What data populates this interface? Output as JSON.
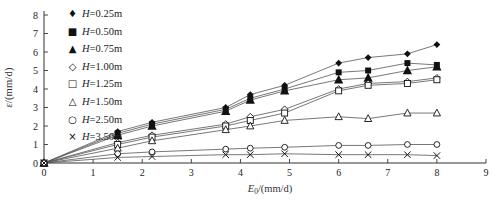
{
  "chart_data": {
    "type": "scatter",
    "x": [
      0,
      1.5,
      2.2,
      3.7,
      4.2,
      4.9,
      6.0,
      6.6,
      7.4,
      8.0
    ],
    "series": [
      {
        "name": "H=0.25m",
        "marker": "filled-diamond",
        "values": [
          0,
          1.7,
          2.2,
          3.0,
          3.7,
          4.2,
          5.4,
          5.7,
          5.9,
          6.4
        ]
      },
      {
        "name": "H=0.50m",
        "marker": "filled-square",
        "values": [
          0,
          1.6,
          2.1,
          2.9,
          3.5,
          4.0,
          4.9,
          5.0,
          5.4,
          5.3
        ]
      },
      {
        "name": "H=0.75m",
        "marker": "filled-triangle",
        "values": [
          0,
          1.5,
          2.0,
          2.8,
          3.4,
          3.9,
          4.5,
          4.6,
          5.0,
          5.2
        ]
      },
      {
        "name": "H=1.00m",
        "marker": "open-diamond",
        "values": [
          0,
          1.1,
          1.5,
          2.1,
          2.5,
          2.9,
          4.0,
          4.3,
          4.4,
          4.6
        ]
      },
      {
        "name": "H=1.25m",
        "marker": "open-square",
        "values": [
          0,
          1.0,
          1.4,
          2.0,
          2.3,
          2.7,
          3.9,
          4.2,
          4.3,
          4.5
        ]
      },
      {
        "name": "H=1.50m",
        "marker": "open-triangle",
        "values": [
          0,
          0.8,
          1.2,
          1.8,
          2.0,
          2.3,
          2.5,
          2.4,
          2.7,
          2.7
        ]
      },
      {
        "name": "H=2.50m",
        "marker": "open-circle",
        "values": [
          0,
          0.5,
          0.6,
          0.75,
          0.8,
          0.85,
          0.95,
          0.95,
          1.0,
          1.0
        ]
      },
      {
        "name": "H=3.50m",
        "marker": "cross",
        "values": [
          0,
          0.3,
          0.35,
          0.45,
          0.45,
          0.5,
          0.45,
          0.45,
          0.45,
          0.4
        ]
      }
    ],
    "xlabel": "E0/(mm/d)",
    "ylabel": "ε/(mm/d)",
    "xlabel_parts": {
      "var": "E",
      "sub": "0",
      "unit": "/(mm/d)"
    },
    "ylabel_parts": {
      "var": "ε",
      "sub": "",
      "unit": "/(mm/d)"
    },
    "xlim": [
      0,
      9
    ],
    "ylim": [
      0,
      8
    ],
    "x_ticks": [
      0,
      1,
      2,
      3,
      4,
      5,
      6,
      7,
      8,
      9
    ],
    "y_ticks": [
      0,
      1,
      2,
      3,
      4,
      5,
      6,
      7,
      8
    ],
    "grid": false,
    "legend_position": "top-left",
    "marker_glyphs": {
      "filled-diamond": "♦",
      "filled-square": "■",
      "filled-triangle": "▲",
      "open-diamond": "◇",
      "open-square": "□",
      "open-triangle": "△",
      "open-circle": "○",
      "cross": "×"
    },
    "colors": {
      "line": "#555555",
      "marker": "#111111",
      "text": "#222222",
      "axis": "#333333"
    }
  }
}
